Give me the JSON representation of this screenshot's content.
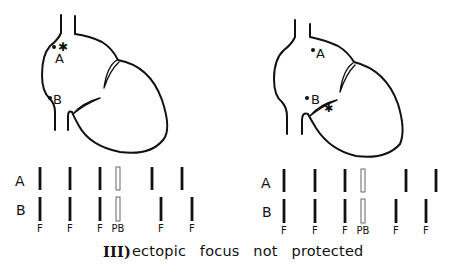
{
  "figure": {
    "caption_numeral": "III)",
    "caption_text": "ectopic focus not protected",
    "colors": {
      "ink": "#111111",
      "background": "#ffffff"
    }
  },
  "panels": [
    {
      "id": "left",
      "heart": {
        "site_labels": [
          "A",
          "B"
        ],
        "ectopic_focus_near": "A",
        "ectopic_focus_symbol": "✱"
      },
      "rhythm_strip": {
        "row_labels": [
          "A",
          "B"
        ],
        "row_A": [
          {
            "x": 40,
            "type": "solid"
          },
          {
            "x": 70,
            "type": "solid"
          },
          {
            "x": 100,
            "type": "solid"
          },
          {
            "x": 118,
            "type": "hollow"
          },
          {
            "x": 152,
            "type": "solid"
          },
          {
            "x": 182,
            "type": "solid"
          }
        ],
        "row_B": [
          {
            "x": 40,
            "type": "solid",
            "label": "F"
          },
          {
            "x": 70,
            "type": "solid",
            "label": "F"
          },
          {
            "x": 100,
            "type": "solid",
            "label": "F"
          },
          {
            "x": 118,
            "type": "hollow",
            "label": "PB"
          },
          {
            "x": 161,
            "type": "solid",
            "label": "F"
          },
          {
            "x": 192,
            "type": "solid",
            "label": "F"
          }
        ]
      }
    },
    {
      "id": "right",
      "heart": {
        "site_labels": [
          "A",
          "B"
        ],
        "ectopic_focus_near": "B",
        "ectopic_focus_symbol": "✱"
      },
      "rhythm_strip": {
        "row_labels": [
          "A",
          "B"
        ],
        "row_A": [
          {
            "x": 284,
            "type": "solid"
          },
          {
            "x": 315,
            "type": "solid"
          },
          {
            "x": 345,
            "type": "solid"
          },
          {
            "x": 363,
            "type": "hollow"
          },
          {
            "x": 406,
            "type": "solid"
          },
          {
            "x": 436,
            "type": "solid"
          }
        ],
        "row_B": [
          {
            "x": 284,
            "type": "solid",
            "label": "F"
          },
          {
            "x": 315,
            "type": "solid",
            "label": "F"
          },
          {
            "x": 345,
            "type": "solid",
            "label": "F"
          },
          {
            "x": 363,
            "type": "hollow",
            "label": "PB"
          },
          {
            "x": 396,
            "type": "solid",
            "label": "F"
          },
          {
            "x": 426,
            "type": "solid",
            "label": "F"
          }
        ]
      }
    }
  ]
}
